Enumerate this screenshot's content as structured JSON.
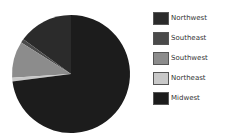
{
  "chart_data": {
    "type": "pie",
    "title": "",
    "legend_position": "right",
    "categories": [
      "Northwest",
      "Southeast",
      "Southwest",
      "Northeast",
      "Midwest"
    ],
    "values": [
      15,
      1,
      10,
      1,
      73
    ],
    "colors": [
      "#2b2b2b",
      "#4a4a4a",
      "#8c8c8c",
      "#c8c8c8",
      "#1c1c1c"
    ]
  }
}
